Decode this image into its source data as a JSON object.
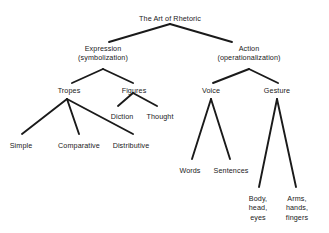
{
  "diagram": {
    "title_node": "The Art of Rhetoric",
    "canvas": {
      "width": 329,
      "height": 233,
      "background": "#ffffff"
    },
    "style": {
      "line_color": "#1a1a1a",
      "text_color": "#1a1a1a"
    },
    "nodes": [
      {
        "id": "root",
        "label": "The Art of Rhetoric",
        "x": 170,
        "y": 14,
        "lines": [
          "The Art of Rhetoric"
        ]
      },
      {
        "id": "expression",
        "label": "Expression (symbolization)",
        "x": 103,
        "y": 44,
        "lines": [
          "Expression",
          "(symbolization)"
        ]
      },
      {
        "id": "action",
        "label": "Action (operationalization)",
        "x": 249,
        "y": 44,
        "lines": [
          "Action",
          "(operationalization)"
        ]
      },
      {
        "id": "tropes",
        "label": "Tropes",
        "x": 69,
        "y": 86,
        "lines": [
          "Tropes"
        ]
      },
      {
        "id": "figures",
        "label": "Figures",
        "x": 134,
        "y": 86,
        "lines": [
          "Figures"
        ]
      },
      {
        "id": "voice",
        "label": "Voice",
        "x": 211,
        "y": 86,
        "lines": [
          "Voice"
        ]
      },
      {
        "id": "gesture",
        "label": "Gesture",
        "x": 277,
        "y": 86,
        "lines": [
          "Gesture"
        ]
      },
      {
        "id": "diction",
        "label": "Diction",
        "x": 122,
        "y": 112,
        "lines": [
          "Diction"
        ]
      },
      {
        "id": "thought",
        "label": "Thought",
        "x": 160,
        "y": 112,
        "lines": [
          "Thought"
        ]
      },
      {
        "id": "simple",
        "label": "Simple",
        "x": 21,
        "y": 141,
        "lines": [
          "Simple"
        ]
      },
      {
        "id": "comparative",
        "label": "Comparative",
        "x": 79,
        "y": 141,
        "lines": [
          "Comparative"
        ]
      },
      {
        "id": "distributive",
        "label": "Distributive",
        "x": 131,
        "y": 141,
        "lines": [
          "Distributive"
        ]
      },
      {
        "id": "words",
        "label": "Words",
        "x": 190,
        "y": 166,
        "lines": [
          "Words"
        ]
      },
      {
        "id": "sentences",
        "label": "Sentences",
        "x": 231,
        "y": 166,
        "lines": [
          "Sentences"
        ]
      },
      {
        "id": "body",
        "label": "Body, head, eyes",
        "x": 258,
        "y": 194,
        "lines": [
          "Body,",
          "head,",
          "eyes"
        ]
      },
      {
        "id": "arms",
        "label": "Arms, hands, fingers",
        "x": 297,
        "y": 194,
        "lines": [
          "Arms,",
          "hands,",
          "fingers"
        ]
      }
    ],
    "edges": [
      {
        "from": "root",
        "to": "expression",
        "x1": 170,
        "y1": 24,
        "x2": 109,
        "y2": 42
      },
      {
        "from": "root",
        "to": "action",
        "x1": 170,
        "y1": 24,
        "x2": 232,
        "y2": 42
      },
      {
        "from": "expression",
        "to": "tropes",
        "x1": 103,
        "y1": 69,
        "x2": 72,
        "y2": 83
      },
      {
        "from": "expression",
        "to": "figures",
        "x1": 103,
        "y1": 69,
        "x2": 133,
        "y2": 83
      },
      {
        "from": "action",
        "to": "voice",
        "x1": 249,
        "y1": 69,
        "x2": 213,
        "y2": 83
      },
      {
        "from": "action",
        "to": "gesture",
        "x1": 249,
        "y1": 69,
        "x2": 278,
        "y2": 83
      },
      {
        "from": "tropes",
        "to": "simple",
        "x1": 67,
        "y1": 99,
        "x2": 22,
        "y2": 134
      },
      {
        "from": "tropes",
        "to": "comparative",
        "x1": 67,
        "y1": 99,
        "x2": 79,
        "y2": 134
      },
      {
        "from": "tropes",
        "to": "distributive",
        "x1": 67,
        "y1": 99,
        "x2": 133,
        "y2": 134
      },
      {
        "from": "figures",
        "to": "diction",
        "x1": 133,
        "y1": 93,
        "x2": 118,
        "y2": 106
      },
      {
        "from": "figures",
        "to": "thought",
        "x1": 133,
        "y1": 93,
        "x2": 157,
        "y2": 106
      },
      {
        "from": "voice",
        "to": "words",
        "x1": 211,
        "y1": 99,
        "x2": 192,
        "y2": 159
      },
      {
        "from": "voice",
        "to": "sentences",
        "x1": 211,
        "y1": 99,
        "x2": 230,
        "y2": 159
      },
      {
        "from": "gesture",
        "to": "body",
        "x1": 277,
        "y1": 99,
        "x2": 259,
        "y2": 187
      },
      {
        "from": "gesture",
        "to": "arms",
        "x1": 277,
        "y1": 99,
        "x2": 296,
        "y2": 187
      }
    ]
  }
}
